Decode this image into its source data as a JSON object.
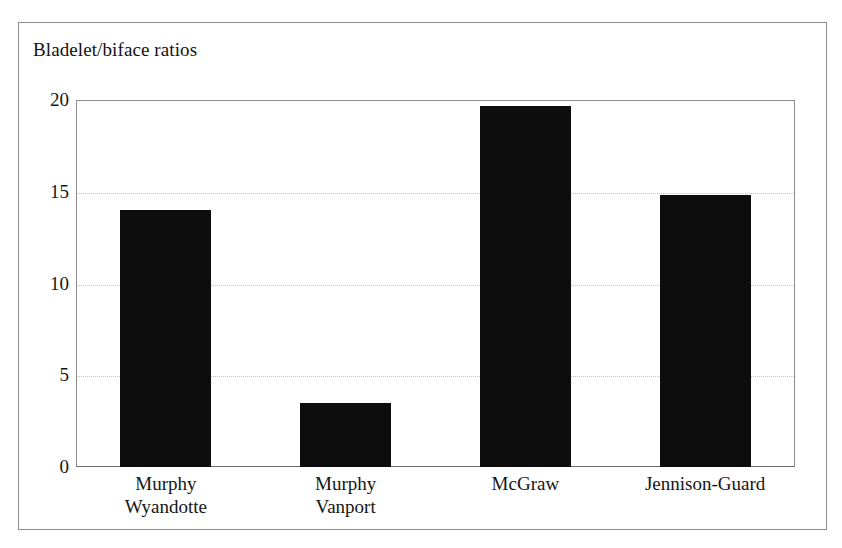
{
  "chart_data": {
    "type": "bar",
    "title": "Bladelet/biface ratios",
    "xlabel": "",
    "ylabel": "",
    "ylim": [
      0,
      20
    ],
    "yticks": [
      0,
      5,
      10,
      15,
      20
    ],
    "ytick_labels": [
      "0",
      "5",
      "10",
      "15",
      "20"
    ],
    "grid": true,
    "grid_axis": "y",
    "legend": false,
    "bar_color": "#0d0d0d",
    "grid_color": "#c4c4c4",
    "frame_color": "#8d8d8d",
    "categories": [
      "Murphy Wyandotte",
      "Murphy Vanport",
      "McGraw",
      "Jennison-Guard"
    ],
    "category_lines": [
      [
        "Murphy",
        "Wyandotte"
      ],
      [
        "Murphy",
        "Vanport"
      ],
      [
        "McGraw",
        ""
      ],
      [
        "Jennison-Guard",
        ""
      ]
    ],
    "values": [
      14.0,
      3.5,
      19.7,
      14.8
    ]
  }
}
